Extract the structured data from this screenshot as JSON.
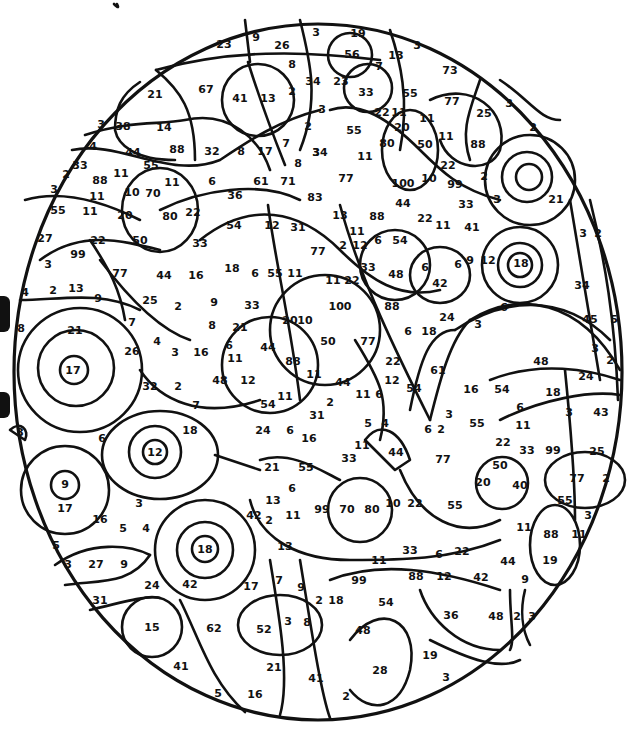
{
  "page": {
    "background": "#ffffff",
    "line_color": "#111111"
  },
  "labels": [
    {
      "t": "23",
      "x": 224,
      "y": 44
    },
    {
      "t": "9",
      "x": 256,
      "y": 37
    },
    {
      "t": "26",
      "x": 282,
      "y": 45
    },
    {
      "t": "3",
      "x": 316,
      "y": 32
    },
    {
      "t": "19",
      "x": 358,
      "y": 33
    },
    {
      "t": "56",
      "x": 352,
      "y": 54
    },
    {
      "t": "7",
      "x": 379,
      "y": 66
    },
    {
      "t": "13",
      "x": 396,
      "y": 55
    },
    {
      "t": "3",
      "x": 417,
      "y": 45
    },
    {
      "t": "73",
      "x": 450,
      "y": 70
    },
    {
      "t": "8",
      "x": 292,
      "y": 64
    },
    {
      "t": "34",
      "x": 313,
      "y": 81
    },
    {
      "t": "23",
      "x": 341,
      "y": 81
    },
    {
      "t": "33",
      "x": 366,
      "y": 92
    },
    {
      "t": "55",
      "x": 410,
      "y": 93
    },
    {
      "t": "21",
      "x": 155,
      "y": 94
    },
    {
      "t": "67",
      "x": 206,
      "y": 89
    },
    {
      "t": "41",
      "x": 240,
      "y": 98
    },
    {
      "t": "13",
      "x": 268,
      "y": 98
    },
    {
      "t": "2",
      "x": 292,
      "y": 91
    },
    {
      "t": "77",
      "x": 452,
      "y": 101
    },
    {
      "t": "25",
      "x": 484,
      "y": 113
    },
    {
      "t": "3",
      "x": 509,
      "y": 103
    },
    {
      "t": "2",
      "x": 533,
      "y": 127
    },
    {
      "t": "3",
      "x": 322,
      "y": 109
    },
    {
      "t": "22",
      "x": 382,
      "y": 112
    },
    {
      "t": "11",
      "x": 399,
      "y": 112
    },
    {
      "t": "11",
      "x": 427,
      "y": 118
    },
    {
      "t": "3",
      "x": 101,
      "y": 124
    },
    {
      "t": "38",
      "x": 123,
      "y": 126
    },
    {
      "t": "14",
      "x": 164,
      "y": 127
    },
    {
      "t": "55",
      "x": 354,
      "y": 130
    },
    {
      "t": "20",
      "x": 402,
      "y": 127
    },
    {
      "t": "11",
      "x": 446,
      "y": 136
    },
    {
      "t": "4",
      "x": 93,
      "y": 146
    },
    {
      "t": "44",
      "x": 133,
      "y": 152
    },
    {
      "t": "88",
      "x": 177,
      "y": 149
    },
    {
      "t": "32",
      "x": 212,
      "y": 151
    },
    {
      "t": "8",
      "x": 241,
      "y": 151
    },
    {
      "t": "17",
      "x": 265,
      "y": 151
    },
    {
      "t": "7",
      "x": 286,
      "y": 143
    },
    {
      "t": "80",
      "x": 387,
      "y": 143
    },
    {
      "t": "50",
      "x": 425,
      "y": 144
    },
    {
      "t": "88",
      "x": 478,
      "y": 144
    },
    {
      "t": "2",
      "x": 308,
      "y": 126
    },
    {
      "t": "3",
      "x": 316,
      "y": 152
    },
    {
      "t": "33",
      "x": 80,
      "y": 165
    },
    {
      "t": "55",
      "x": 151,
      "y": 165
    },
    {
      "t": "8",
      "x": 298,
      "y": 163
    },
    {
      "t": "34",
      "x": 320,
      "y": 152
    },
    {
      "t": "11",
      "x": 365,
      "y": 156
    },
    {
      "t": "22",
      "x": 448,
      "y": 165
    },
    {
      "t": "2",
      "x": 66,
      "y": 174
    },
    {
      "t": "88",
      "x": 100,
      "y": 180
    },
    {
      "t": "11",
      "x": 121,
      "y": 173
    },
    {
      "t": "11",
      "x": 172,
      "y": 182
    },
    {
      "t": "6",
      "x": 212,
      "y": 181
    },
    {
      "t": "61",
      "x": 261,
      "y": 181
    },
    {
      "t": "71",
      "x": 288,
      "y": 181
    },
    {
      "t": "77",
      "x": 346,
      "y": 178
    },
    {
      "t": "100",
      "x": 403,
      "y": 183
    },
    {
      "t": "10",
      "x": 429,
      "y": 178
    },
    {
      "t": "99",
      "x": 455,
      "y": 184
    },
    {
      "t": "2",
      "x": 484,
      "y": 176
    },
    {
      "t": "3",
      "x": 54,
      "y": 189
    },
    {
      "t": "10",
      "x": 132,
      "y": 192
    },
    {
      "t": "70",
      "x": 153,
      "y": 193
    },
    {
      "t": "36",
      "x": 235,
      "y": 195
    },
    {
      "t": "83",
      "x": 315,
      "y": 197
    },
    {
      "t": "44",
      "x": 403,
      "y": 203
    },
    {
      "t": "33",
      "x": 466,
      "y": 204
    },
    {
      "t": "3",
      "x": 497,
      "y": 199
    },
    {
      "t": "21",
      "x": 556,
      "y": 199
    },
    {
      "t": "55",
      "x": 58,
      "y": 210
    },
    {
      "t": "11",
      "x": 97,
      "y": 196
    },
    {
      "t": "11",
      "x": 90,
      "y": 211
    },
    {
      "t": "20",
      "x": 125,
      "y": 215
    },
    {
      "t": "80",
      "x": 170,
      "y": 216
    },
    {
      "t": "22",
      "x": 193,
      "y": 212
    },
    {
      "t": "54",
      "x": 234,
      "y": 225
    },
    {
      "t": "12",
      "x": 272,
      "y": 225
    },
    {
      "t": "31",
      "x": 298,
      "y": 227
    },
    {
      "t": "13",
      "x": 340,
      "y": 215
    },
    {
      "t": "88",
      "x": 377,
      "y": 216
    },
    {
      "t": "22",
      "x": 425,
      "y": 218
    },
    {
      "t": "11",
      "x": 443,
      "y": 225
    },
    {
      "t": "41",
      "x": 472,
      "y": 227
    },
    {
      "t": "27",
      "x": 45,
      "y": 238
    },
    {
      "t": "22",
      "x": 98,
      "y": 240
    },
    {
      "t": "50",
      "x": 140,
      "y": 240
    },
    {
      "t": "33",
      "x": 200,
      "y": 243
    },
    {
      "t": "11",
      "x": 357,
      "y": 231
    },
    {
      "t": "6",
      "x": 378,
      "y": 240
    },
    {
      "t": "54",
      "x": 400,
      "y": 240
    },
    {
      "t": "3",
      "x": 583,
      "y": 233
    },
    {
      "t": "2",
      "x": 598,
      "y": 233
    },
    {
      "t": "99",
      "x": 78,
      "y": 254
    },
    {
      "t": "77",
      "x": 120,
      "y": 273
    },
    {
      "t": "44",
      "x": 164,
      "y": 275
    },
    {
      "t": "16",
      "x": 196,
      "y": 275
    },
    {
      "t": "18",
      "x": 232,
      "y": 268
    },
    {
      "t": "6",
      "x": 255,
      "y": 273
    },
    {
      "t": "55",
      "x": 275,
      "y": 273
    },
    {
      "t": "11",
      "x": 295,
      "y": 273
    },
    {
      "t": "77",
      "x": 318,
      "y": 251
    },
    {
      "t": "2",
      "x": 343,
      "y": 245
    },
    {
      "t": "12",
      "x": 360,
      "y": 245
    },
    {
      "t": "33",
      "x": 368,
      "y": 267
    },
    {
      "t": "48",
      "x": 396,
      "y": 274
    },
    {
      "t": "11",
      "x": 333,
      "y": 280
    },
    {
      "t": "22",
      "x": 352,
      "y": 280
    },
    {
      "t": "6",
      "x": 425,
      "y": 267
    },
    {
      "t": "42",
      "x": 440,
      "y": 283
    },
    {
      "t": "6",
      "x": 458,
      "y": 264
    },
    {
      "t": "9",
      "x": 470,
      "y": 260
    },
    {
      "t": "12",
      "x": 488,
      "y": 260
    },
    {
      "t": "18",
      "x": 521,
      "y": 263
    },
    {
      "t": "3",
      "x": 48,
      "y": 264
    },
    {
      "t": "4",
      "x": 25,
      "y": 292
    },
    {
      "t": "2",
      "x": 53,
      "y": 290
    },
    {
      "t": "13",
      "x": 76,
      "y": 288
    },
    {
      "t": "9",
      "x": 98,
      "y": 298
    },
    {
      "t": "25",
      "x": 150,
      "y": 300
    },
    {
      "t": "2",
      "x": 178,
      "y": 306
    },
    {
      "t": "9",
      "x": 214,
      "y": 302
    },
    {
      "t": "33",
      "x": 252,
      "y": 305
    },
    {
      "t": "20",
      "x": 290,
      "y": 320
    },
    {
      "t": "10",
      "x": 305,
      "y": 320
    },
    {
      "t": "100",
      "x": 340,
      "y": 306
    },
    {
      "t": "88",
      "x": 392,
      "y": 306
    },
    {
      "t": "34",
      "x": 582,
      "y": 285
    },
    {
      "t": "8",
      "x": 21,
      "y": 328
    },
    {
      "t": "7",
      "x": 132,
      "y": 322
    },
    {
      "t": "21",
      "x": 75,
      "y": 330
    },
    {
      "t": "8",
      "x": 212,
      "y": 325
    },
    {
      "t": "21",
      "x": 240,
      "y": 327
    },
    {
      "t": "3",
      "x": 478,
      "y": 324
    },
    {
      "t": "6",
      "x": 504,
      "y": 307
    },
    {
      "t": "45",
      "x": 590,
      "y": 319
    },
    {
      "t": "5",
      "x": 614,
      "y": 319
    },
    {
      "t": "4",
      "x": 157,
      "y": 341
    },
    {
      "t": "26",
      "x": 132,
      "y": 351
    },
    {
      "t": "3",
      "x": 175,
      "y": 352
    },
    {
      "t": "16",
      "x": 201,
      "y": 352
    },
    {
      "t": "6",
      "x": 229,
      "y": 345
    },
    {
      "t": "44",
      "x": 268,
      "y": 347
    },
    {
      "t": "88",
      "x": 293,
      "y": 361
    },
    {
      "t": "50",
      "x": 328,
      "y": 341
    },
    {
      "t": "77",
      "x": 368,
      "y": 341
    },
    {
      "t": "6",
      "x": 408,
      "y": 331
    },
    {
      "t": "18",
      "x": 429,
      "y": 331
    },
    {
      "t": "24",
      "x": 447,
      "y": 317
    },
    {
      "t": "17",
      "x": 73,
      "y": 370
    },
    {
      "t": "11",
      "x": 235,
      "y": 358
    },
    {
      "t": "22",
      "x": 393,
      "y": 361
    },
    {
      "t": "61",
      "x": 438,
      "y": 370
    },
    {
      "t": "48",
      "x": 541,
      "y": 361
    },
    {
      "t": "3",
      "x": 595,
      "y": 348
    },
    {
      "t": "2",
      "x": 610,
      "y": 360
    },
    {
      "t": "32",
      "x": 150,
      "y": 386
    },
    {
      "t": "2",
      "x": 178,
      "y": 386
    },
    {
      "t": "48",
      "x": 220,
      "y": 380
    },
    {
      "t": "12",
      "x": 248,
      "y": 380
    },
    {
      "t": "11",
      "x": 314,
      "y": 374
    },
    {
      "t": "44",
      "x": 343,
      "y": 382
    },
    {
      "t": "12",
      "x": 392,
      "y": 380
    },
    {
      "t": "11",
      "x": 363,
      "y": 394
    },
    {
      "t": "6",
      "x": 379,
      "y": 394
    },
    {
      "t": "54",
      "x": 414,
      "y": 388
    },
    {
      "t": "16",
      "x": 471,
      "y": 389
    },
    {
      "t": "54",
      "x": 502,
      "y": 389
    },
    {
      "t": "18",
      "x": 553,
      "y": 392
    },
    {
      "t": "24",
      "x": 586,
      "y": 376
    },
    {
      "t": "7",
      "x": 196,
      "y": 405
    },
    {
      "t": "54",
      "x": 268,
      "y": 404
    },
    {
      "t": "11",
      "x": 285,
      "y": 396
    },
    {
      "t": "2",
      "x": 330,
      "y": 402
    },
    {
      "t": "6",
      "x": 520,
      "y": 407
    },
    {
      "t": "3",
      "x": 569,
      "y": 412
    },
    {
      "t": "43",
      "x": 601,
      "y": 412
    },
    {
      "t": "31",
      "x": 317,
      "y": 415
    },
    {
      "t": "3",
      "x": 449,
      "y": 414
    },
    {
      "t": "6",
      "x": 428,
      "y": 429
    },
    {
      "t": "2",
      "x": 441,
      "y": 429
    },
    {
      "t": "55",
      "x": 477,
      "y": 423
    },
    {
      "t": "11",
      "x": 523,
      "y": 425
    },
    {
      "t": "3",
      "x": 20,
      "y": 432
    },
    {
      "t": "6",
      "x": 102,
      "y": 438
    },
    {
      "t": "18",
      "x": 190,
      "y": 430
    },
    {
      "t": "24",
      "x": 263,
      "y": 430
    },
    {
      "t": "6",
      "x": 290,
      "y": 430
    },
    {
      "t": "5",
      "x": 368,
      "y": 423
    },
    {
      "t": "4",
      "x": 385,
      "y": 423
    },
    {
      "t": "16",
      "x": 309,
      "y": 438
    },
    {
      "t": "11",
      "x": 362,
      "y": 445
    },
    {
      "t": "44",
      "x": 396,
      "y": 452
    },
    {
      "t": "22",
      "x": 503,
      "y": 442
    },
    {
      "t": "33",
      "x": 527,
      "y": 450
    },
    {
      "t": "99",
      "x": 553,
      "y": 450
    },
    {
      "t": "25",
      "x": 597,
      "y": 451
    },
    {
      "t": "12",
      "x": 155,
      "y": 452
    },
    {
      "t": "33",
      "x": 349,
      "y": 458
    },
    {
      "t": "77",
      "x": 443,
      "y": 459
    },
    {
      "t": "21",
      "x": 272,
      "y": 467
    },
    {
      "t": "55",
      "x": 306,
      "y": 467
    },
    {
      "t": "50",
      "x": 500,
      "y": 465
    },
    {
      "t": "9",
      "x": 65,
      "y": 484
    },
    {
      "t": "20",
      "x": 483,
      "y": 482
    },
    {
      "t": "40",
      "x": 520,
      "y": 485
    },
    {
      "t": "77",
      "x": 577,
      "y": 478
    },
    {
      "t": "2",
      "x": 606,
      "y": 478
    },
    {
      "t": "6",
      "x": 292,
      "y": 488
    },
    {
      "t": "13",
      "x": 273,
      "y": 500
    },
    {
      "t": "11",
      "x": 293,
      "y": 515
    },
    {
      "t": "99",
      "x": 322,
      "y": 509
    },
    {
      "t": "70",
      "x": 347,
      "y": 509
    },
    {
      "t": "80",
      "x": 372,
      "y": 509
    },
    {
      "t": "10",
      "x": 393,
      "y": 503
    },
    {
      "t": "22",
      "x": 415,
      "y": 503
    },
    {
      "t": "55",
      "x": 455,
      "y": 505
    },
    {
      "t": "3",
      "x": 139,
      "y": 503
    },
    {
      "t": "17",
      "x": 65,
      "y": 508
    },
    {
      "t": "16",
      "x": 100,
      "y": 519
    },
    {
      "t": "5",
      "x": 123,
      "y": 528
    },
    {
      "t": "4",
      "x": 146,
      "y": 528
    },
    {
      "t": "42",
      "x": 254,
      "y": 515
    },
    {
      "t": "2",
      "x": 269,
      "y": 520
    },
    {
      "t": "55",
      "x": 565,
      "y": 500
    },
    {
      "t": "3",
      "x": 588,
      "y": 515
    },
    {
      "t": "11",
      "x": 524,
      "y": 527
    },
    {
      "t": "88",
      "x": 551,
      "y": 534
    },
    {
      "t": "11",
      "x": 579,
      "y": 534
    },
    {
      "t": "5",
      "x": 56,
      "y": 545
    },
    {
      "t": "13",
      "x": 285,
      "y": 546
    },
    {
      "t": "33",
      "x": 410,
      "y": 550
    },
    {
      "t": "6",
      "x": 439,
      "y": 554
    },
    {
      "t": "22",
      "x": 462,
      "y": 551
    },
    {
      "t": "44",
      "x": 508,
      "y": 561
    },
    {
      "t": "19",
      "x": 550,
      "y": 560
    },
    {
      "t": "18",
      "x": 205,
      "y": 549
    },
    {
      "t": "3",
      "x": 68,
      "y": 564
    },
    {
      "t": "27",
      "x": 96,
      "y": 564
    },
    {
      "t": "9",
      "x": 124,
      "y": 564
    },
    {
      "t": "11",
      "x": 379,
      "y": 560
    },
    {
      "t": "88",
      "x": 416,
      "y": 576
    },
    {
      "t": "12",
      "x": 444,
      "y": 576
    },
    {
      "t": "42",
      "x": 481,
      "y": 577
    },
    {
      "t": "9",
      "x": 525,
      "y": 579
    },
    {
      "t": "24",
      "x": 152,
      "y": 585
    },
    {
      "t": "42",
      "x": 190,
      "y": 584
    },
    {
      "t": "17",
      "x": 251,
      "y": 586
    },
    {
      "t": "7",
      "x": 279,
      "y": 580
    },
    {
      "t": "9",
      "x": 301,
      "y": 587
    },
    {
      "t": "99",
      "x": 359,
      "y": 580
    },
    {
      "t": "31",
      "x": 100,
      "y": 600
    },
    {
      "t": "2",
      "x": 319,
      "y": 600
    },
    {
      "t": "18",
      "x": 336,
      "y": 600
    },
    {
      "t": "54",
      "x": 386,
      "y": 602
    },
    {
      "t": "15",
      "x": 152,
      "y": 627
    },
    {
      "t": "62",
      "x": 214,
      "y": 628
    },
    {
      "t": "52",
      "x": 264,
      "y": 629
    },
    {
      "t": "3",
      "x": 288,
      "y": 621
    },
    {
      "t": "8",
      "x": 307,
      "y": 622
    },
    {
      "t": "48",
      "x": 363,
      "y": 630
    },
    {
      "t": "36",
      "x": 451,
      "y": 615
    },
    {
      "t": "48",
      "x": 496,
      "y": 616
    },
    {
      "t": "2",
      "x": 517,
      "y": 616
    },
    {
      "t": "3",
      "x": 532,
      "y": 616
    },
    {
      "t": "41",
      "x": 181,
      "y": 666
    },
    {
      "t": "21",
      "x": 274,
      "y": 667
    },
    {
      "t": "41",
      "x": 316,
      "y": 678
    },
    {
      "t": "28",
      "x": 380,
      "y": 670
    },
    {
      "t": "19",
      "x": 430,
      "y": 655
    },
    {
      "t": "5",
      "x": 218,
      "y": 693
    },
    {
      "t": "16",
      "x": 255,
      "y": 694
    },
    {
      "t": "2",
      "x": 346,
      "y": 696
    },
    {
      "t": "3",
      "x": 446,
      "y": 677
    }
  ]
}
